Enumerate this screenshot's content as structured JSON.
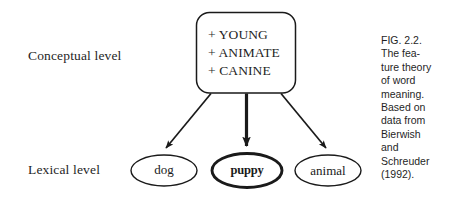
{
  "figure": {
    "background_color": "#ffffff",
    "stroke_color": "#1a1a1a",
    "levels": {
      "conceptual_label": "Conceptual level",
      "lexical_label": "Lexical level"
    },
    "concept_box": {
      "shape": "rounded-rectangle",
      "features": [
        "+ YOUNG",
        "+ ANIMATE",
        "+ CANINE"
      ]
    },
    "lexical_nodes": [
      {
        "id": "dog",
        "label": "dog",
        "emphasis": "normal",
        "shape": "ellipse"
      },
      {
        "id": "puppy",
        "label": "puppy",
        "emphasis": "bold",
        "shape": "ellipse"
      },
      {
        "id": "animal",
        "label": "animal",
        "emphasis": "normal",
        "shape": "ellipse"
      }
    ],
    "arrows": [
      {
        "id": "arrow-to-dog",
        "from": "concept-box",
        "to": "dog",
        "weight": "thin"
      },
      {
        "id": "arrow-to-puppy",
        "from": "concept-box",
        "to": "puppy",
        "weight": "thick"
      },
      {
        "id": "arrow-to-animal",
        "from": "concept-box",
        "to": "animal",
        "weight": "thin"
      }
    ],
    "caption": {
      "lines": [
        "FIG. 2.2.",
        "The fea-",
        "ture theory",
        "of word",
        "meaning.",
        "Based on",
        "data from",
        "Bierwish",
        "and",
        "Schreuder",
        "(1992)."
      ]
    }
  }
}
